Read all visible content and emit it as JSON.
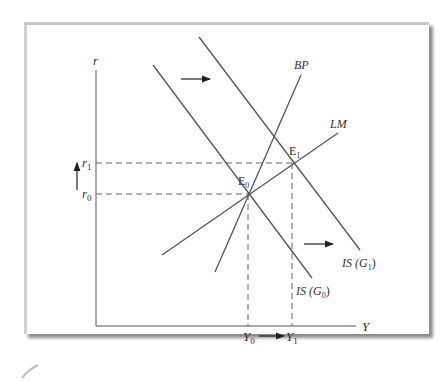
{
  "diagram": {
    "type": "IS-LM-BP",
    "axes": {
      "y_axis_label": "r",
      "x_axis_label": "Y",
      "y_ticks": [
        {
          "label": "r",
          "sub": "1"
        },
        {
          "label": "r",
          "sub": "0"
        }
      ],
      "x_ticks": [
        {
          "label": "Y",
          "sub": "0"
        },
        {
          "label": "Y",
          "sub": "1"
        }
      ]
    },
    "curves": {
      "bp": {
        "label": "BP"
      },
      "lm": {
        "label": "LM"
      },
      "is0": {
        "label": "IS",
        "arg": "(G",
        "sub": "0",
        "close": ")"
      },
      "is1": {
        "label": "IS",
        "arg": "(G",
        "sub": "1",
        "close": ")"
      }
    },
    "equilibria": {
      "e0": {
        "label": "E",
        "sub": "0"
      },
      "e1": {
        "label": "E",
        "sub": "1"
      }
    },
    "colors": {
      "line": "#555555",
      "dash": "#666666",
      "frame_shadow": "#8c8c8c"
    }
  }
}
